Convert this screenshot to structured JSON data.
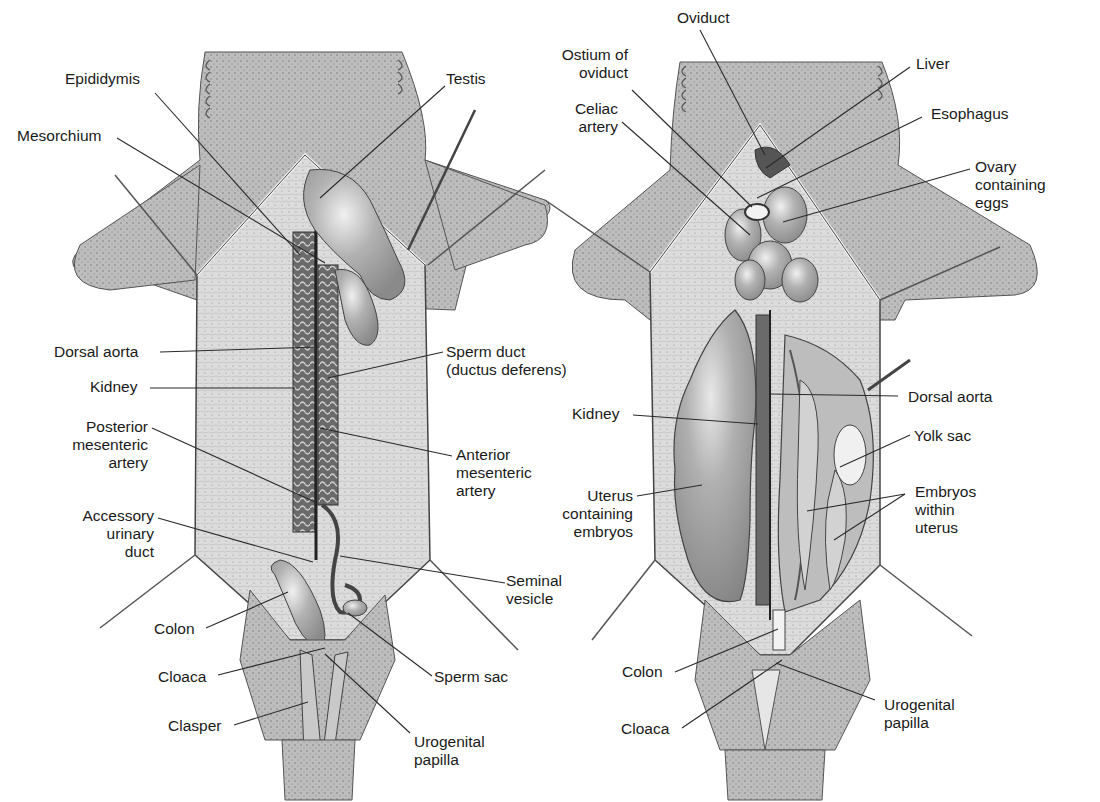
{
  "figure": {
    "panels": [
      {
        "id": "male",
        "labels": [
          {
            "text": "Epididymis",
            "x": 65,
            "y": 70,
            "align": "left",
            "line": [
              [
                155,
                93
              ],
              [
                300,
                255
              ]
            ]
          },
          {
            "text": "Testis",
            "x": 446,
            "y": 70,
            "align": "left",
            "line": [
              [
                445,
                86
              ],
              [
                320,
                198
              ]
            ]
          },
          {
            "text": "Mesorchium",
            "x": 17,
            "y": 127,
            "align": "left",
            "line": [
              [
                117,
                138
              ],
              [
                325,
                263
              ]
            ]
          },
          {
            "text": "Dorsal aorta",
            "x": 54,
            "y": 343,
            "align": "left",
            "line": [
              [
                160,
                352
              ],
              [
                318,
                347
              ]
            ]
          },
          {
            "text": "Sperm duct\n(ductus deferens)",
            "x": 446,
            "y": 343,
            "align": "left",
            "line": [
              [
                443,
                352
              ],
              [
                328,
                378
              ]
            ]
          },
          {
            "text": "Kidney",
            "x": 90,
            "y": 378,
            "align": "left",
            "line": [
              [
                150,
                388
              ],
              [
                295,
                388
              ]
            ]
          },
          {
            "text": "Posterior\nmesenteric\nartery",
            "x": 60,
            "y": 418,
            "align": "right",
            "line": [
              [
                152,
                428
              ],
              [
                315,
                502
              ]
            ]
          },
          {
            "text": "Anterior\nmesenteric\nartery",
            "x": 456,
            "y": 446,
            "align": "left",
            "line": [
              [
                452,
                456
              ],
              [
                320,
                428
              ]
            ]
          },
          {
            "text": "Accessory\nurinary\nduct",
            "x": 60,
            "y": 507,
            "align": "right",
            "line": [
              [
                158,
                518
              ],
              [
                313,
                562
              ]
            ]
          },
          {
            "text": "Seminal\nvesicle",
            "x": 506,
            "y": 572,
            "align": "left",
            "line": [
              [
                505,
                583
              ],
              [
                340,
                556
              ]
            ]
          },
          {
            "text": "Colon",
            "x": 154,
            "y": 620,
            "align": "left",
            "line": [
              [
                206,
                628
              ],
              [
                288,
                592
              ]
            ]
          },
          {
            "text": "Cloaca",
            "x": 158,
            "y": 668,
            "align": "left",
            "line": [
              [
                218,
                675
              ],
              [
                325,
                648
              ]
            ]
          },
          {
            "text": "Sperm sac",
            "x": 434,
            "y": 668,
            "align": "left",
            "line": [
              [
                432,
                676
              ],
              [
                348,
                613
              ]
            ]
          },
          {
            "text": "Clasper",
            "x": 168,
            "y": 717,
            "align": "left",
            "line": [
              [
                234,
                725
              ],
              [
                308,
                702
              ]
            ]
          },
          {
            "text": "Urogenital\npapilla",
            "x": 414,
            "y": 733,
            "align": "left",
            "line": [
              [
                410,
                733
              ],
              [
                325,
                654
              ]
            ]
          }
        ]
      },
      {
        "id": "female",
        "labels": [
          {
            "text": "Oviduct",
            "x": 677,
            "y": 9,
            "align": "left",
            "line": [
              [
                700,
                30
              ],
              [
                765,
                155
              ]
            ]
          },
          {
            "text": "Ostium of\noviduct",
            "x": 563,
            "y": 46,
            "align": "right",
            "line": [
              [
                632,
                90
              ],
              [
                752,
                207
              ]
            ]
          },
          {
            "text": "Liver",
            "x": 916,
            "y": 55,
            "align": "left",
            "line": [
              [
                910,
                67
              ],
              [
                766,
                168
              ]
            ]
          },
          {
            "text": "Celiac\nartery",
            "x": 563,
            "y": 100,
            "align": "right",
            "line": [
              [
                622,
                122
              ],
              [
                750,
                235
              ]
            ]
          },
          {
            "text": "Esophagus",
            "x": 931,
            "y": 105,
            "align": "left",
            "line": [
              [
                922,
                117
              ],
              [
                757,
                198
              ]
            ]
          },
          {
            "text": "Ovary\ncontaining\neggs",
            "x": 975,
            "y": 158,
            "align": "left",
            "line": [
              [
                970,
                169
              ],
              [
                783,
                222
              ]
            ]
          },
          {
            "text": "Dorsal aorta",
            "x": 908,
            "y": 388,
            "align": "left",
            "line": [
              [
                898,
                396
              ],
              [
                770,
                394
              ]
            ]
          },
          {
            "text": "Kidney",
            "x": 572,
            "y": 405,
            "align": "left",
            "line": [
              [
                633,
                415
              ],
              [
                758,
                424
              ]
            ]
          },
          {
            "text": "Yolk sac",
            "x": 914,
            "y": 427,
            "align": "left",
            "line": [
              [
                910,
                435
              ],
              [
                840,
                467
              ]
            ]
          },
          {
            "text": "Uterus\ncontaining\nembryos",
            "x": 571,
            "y": 487,
            "align": "right",
            "line": [
              [
                637,
                496
              ],
              [
                702,
                485
              ]
            ]
          },
          {
            "text": "Embryos\nwithin\nuterus",
            "x": 915,
            "y": 483,
            "align": "left",
            "line": [
              [
                905,
                494
              ],
              [
                807,
                511
              ]
            ]
          },
          {
            "text": "Colon",
            "x": 622,
            "y": 663,
            "align": "left",
            "line": [
              [
                675,
                672
              ],
              [
                778,
                629
              ]
            ]
          },
          {
            "text": "Urogenital\npapilla",
            "x": 884,
            "y": 696,
            "align": "left",
            "line": [
              [
                875,
                700
              ],
              [
                776,
                663
              ]
            ]
          },
          {
            "text": "Cloaca",
            "x": 621,
            "y": 720,
            "align": "left",
            "line": [
              [
                682,
                728
              ],
              [
                782,
                660
              ]
            ]
          }
        ],
        "extra_lines": [
          [
            [
              905,
              494
            ],
            [
              834,
              540
            ]
          ]
        ]
      }
    ],
    "colors": {
      "background": "#ffffff",
      "skin": "#b9b9b9",
      "skin_dark": "#8a8a8a",
      "muscle": "#d8d8d8",
      "organ": "#a8a8a8",
      "organ_light": "#cfcfcf",
      "line": "#2a2a2a",
      "text": "#1a1a1a"
    }
  }
}
